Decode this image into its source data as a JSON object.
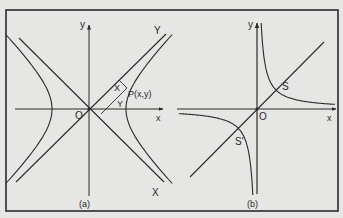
{
  "figure": {
    "background": "#e6e6e4",
    "ink": "#2a2a2a",
    "frame": {
      "x": 6,
      "y": 10,
      "w": 332,
      "h": 201
    }
  },
  "panel_a": {
    "caption": "(a)",
    "origin_label": "O",
    "x_axis_label": "x",
    "y_axis_label": "y",
    "rotated_x_label": "X",
    "rotated_y_label": "Y",
    "point_label": "P(x,y)",
    "proj_x_label": "X",
    "proj_y_label": "Y",
    "description": "Rectangular hyperbola x^2 - y^2 = a^2 with asymptotes y = ±x forming rotated X,Y axes"
  },
  "panel_b": {
    "caption": "(b)",
    "origin_label": "O",
    "x_axis_label": "x",
    "y_axis_label": "y",
    "vertex_label": "S",
    "vertex2_label": "S'",
    "description": "Rectangular hyperbola xy = c^2 with symmetry line y = x through vertices S and S'"
  }
}
